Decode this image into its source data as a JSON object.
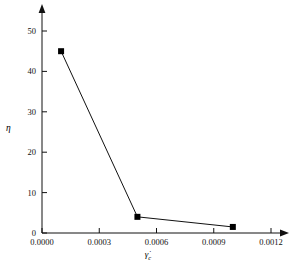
{
  "chart_data": {
    "type": "line",
    "title": "",
    "subtitle": "",
    "xlabel": "γ̇",
    "xlabel_subscript": "c",
    "ylabel": "η",
    "xlim": [
      0.0,
      0.0012
    ],
    "ylim": [
      0,
      50
    ],
    "xticks": [
      0.0,
      0.0003,
      0.0006,
      0.0009,
      0.0012
    ],
    "xtick_labels": [
      "0.0000",
      "0.0003",
      "0.0006",
      "0.0009",
      "0.0012"
    ],
    "yticks": [
      0,
      10,
      20,
      30,
      40,
      50
    ],
    "ytick_labels": [
      "0",
      "10",
      "20",
      "30",
      "40",
      "50"
    ],
    "grid": false,
    "legend": null,
    "marker": "filled-square",
    "line_color": "#000000",
    "marker_color": "#000000",
    "series": [
      {
        "name": "eta vs gamma-dot-c",
        "x": [
          0.0001,
          0.0005,
          0.001
        ],
        "values": [
          45.0,
          4.0,
          1.5
        ]
      }
    ],
    "points": [
      {
        "x": 0.0001,
        "y": 45.0
      },
      {
        "x": 0.0005,
        "y": 4.0
      },
      {
        "x": 0.001,
        "y": 1.5
      }
    ],
    "axis_style": "arrow-tipped-L-axes"
  },
  "axes": {
    "y_title": "η",
    "x_title_base": "γ̇",
    "x_title_sub": "c"
  }
}
